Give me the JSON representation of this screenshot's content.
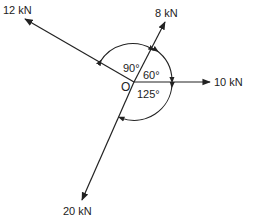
{
  "diagram": {
    "type": "concurrent force system",
    "origin_label": "O",
    "forces": [
      {
        "label": "12 kN",
        "direction": "upper-left"
      },
      {
        "label": "8 kN",
        "direction": "upper-right"
      },
      {
        "label": "10 kN",
        "direction": "right (horizontal)"
      },
      {
        "label": "20 kN",
        "direction": "lower-left"
      }
    ],
    "angles": [
      {
        "label": "90°",
        "between": [
          "12 kN",
          "8 kN"
        ]
      },
      {
        "label": "60°",
        "between": [
          "8 kN",
          "10 kN"
        ]
      },
      {
        "label": "125°",
        "between": [
          "10 kN",
          "20 kN"
        ]
      }
    ],
    "colors": {
      "line": "#222222",
      "background": "#ffffff"
    }
  }
}
